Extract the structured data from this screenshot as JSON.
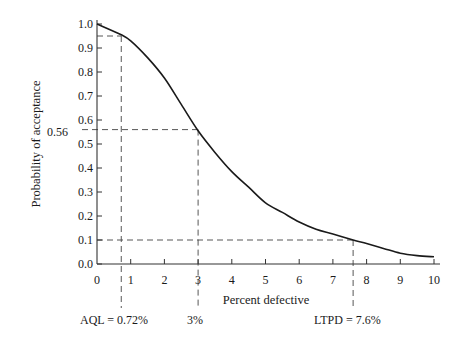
{
  "chart_data": {
    "type": "line",
    "title": "",
    "xlabel": "Percent defective",
    "ylabel": "Probability of acceptance",
    "xlim": [
      0,
      10
    ],
    "ylim": [
      0.0,
      1.0
    ],
    "x_ticks": [
      "0",
      "1",
      "2",
      "3",
      "4",
      "5",
      "6",
      "7",
      "8",
      "9",
      "10"
    ],
    "y_ticks": [
      "0.0",
      "0.1",
      "0.2",
      "0.3",
      "0.4",
      "0.5",
      "0.6",
      "0.7",
      "0.8",
      "0.9",
      "1.0"
    ],
    "grid": false,
    "legend": null,
    "series": [
      {
        "name": "Operating characteristic curve",
        "x": [
          0,
          0.72,
          1,
          1.5,
          2,
          2.5,
          3,
          3.5,
          4,
          4.5,
          5,
          5.5,
          6,
          6.5,
          7,
          7.6,
          8,
          8.5,
          9,
          9.5,
          10
        ],
        "y": [
          1.0,
          0.955,
          0.93,
          0.86,
          0.775,
          0.665,
          0.555,
          0.465,
          0.385,
          0.32,
          0.255,
          0.215,
          0.175,
          0.145,
          0.125,
          0.1,
          0.085,
          0.065,
          0.045,
          0.035,
          0.03
        ]
      }
    ],
    "reference_lines": [
      {
        "label": "AQL = 0.72%",
        "x": 0.72,
        "y": 0.95
      },
      {
        "label": "3%",
        "x": 3,
        "y": 0.56,
        "y_label": "0.56"
      },
      {
        "label": "LTPD = 7.6%",
        "x": 7.6,
        "y": 0.1
      }
    ]
  },
  "labels": {
    "xlabel": "Percent defective",
    "ylabel": "Probability of acceptance",
    "aql": "AQL = 0.72%",
    "mid": "3%",
    "ltpd": "LTPD = 7.6%",
    "y056": "0.56"
  }
}
